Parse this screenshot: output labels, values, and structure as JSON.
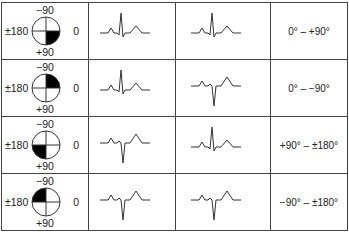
{
  "axis_labels": {
    "top": "−90",
    "left": "±180",
    "right": "0",
    "bottom": "+90"
  },
  "rows": [
    {
      "filled_quadrant": "lower-right",
      "lead_i": "positive",
      "lead_avf": "positive",
      "range": "0° – +90°"
    },
    {
      "filled_quadrant": "upper-right",
      "lead_i": "positive",
      "lead_avf": "negative",
      "range": "0° – −90°"
    },
    {
      "filled_quadrant": "lower-left",
      "lead_i": "negative",
      "lead_avf": "positive",
      "range": "+90° – ±180°"
    },
    {
      "filled_quadrant": "upper-left",
      "lead_i": "negative",
      "lead_avf": "negative",
      "range": "−90° – ±180°"
    }
  ],
  "colors": {
    "line": "#333333",
    "fill": "#000000",
    "border": "#444444"
  }
}
